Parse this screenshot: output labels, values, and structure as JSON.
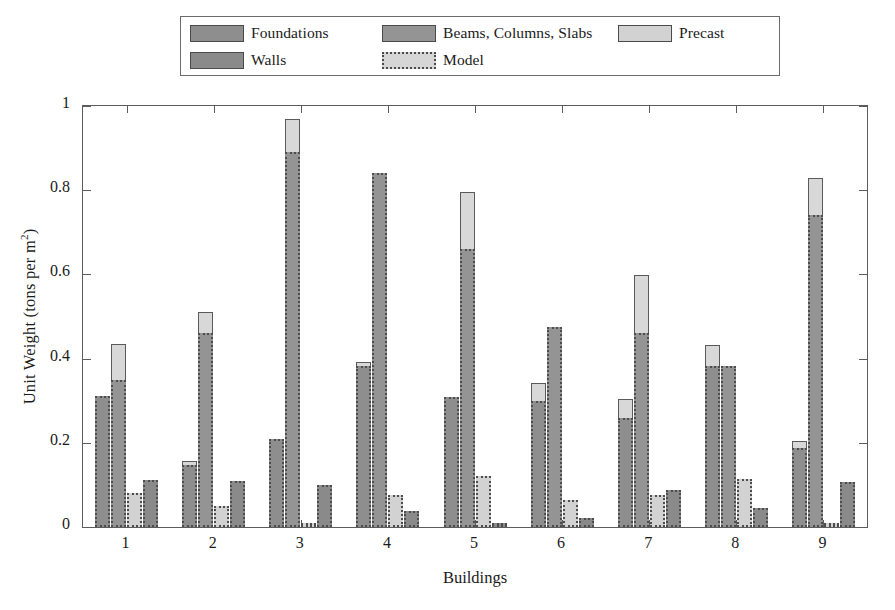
{
  "legend": {
    "entries": [
      {
        "label": "Foundations",
        "swatch": "foundations-swatch"
      },
      {
        "label": "Beams, Columns, Slabs",
        "swatch": "beams-columns-slabs-swatch"
      },
      {
        "label": "Precast",
        "swatch": "precast-swatch"
      },
      {
        "label": "Walls",
        "swatch": "walls-swatch"
      },
      {
        "label": "Model",
        "swatch": "model-swatch"
      }
    ]
  },
  "colors": {
    "foundations": "#8e8e8e",
    "beams": "#949494",
    "precast": "#d2d2d2",
    "walls": "#8a8a8a",
    "model": "#d8d8d8",
    "outline": "#4d4d4d",
    "axis": "#5c5c5c",
    "background": "#ffffff"
  },
  "chart_data": {
    "type": "bar",
    "title": "",
    "xlabel": "Buildings",
    "ylabel": "Unit Weight (tons per m 2)",
    "ylabel_base": "Unit Weight (tons per m",
    "ylabel_exp": "2",
    "ylabel_close": ")",
    "categories": [
      "1",
      "2",
      "3",
      "4",
      "5",
      "6",
      "7",
      "8",
      "9"
    ],
    "ylim": [
      0,
      1
    ],
    "yticks": [
      0,
      0.2,
      0.4,
      0.6,
      0.8,
      1
    ],
    "ytick_labels": [
      "0",
      "0.2",
      "0.4",
      "0.6",
      "0.8",
      "1"
    ],
    "grid": false,
    "legend_position": "above-plot",
    "series": [
      {
        "name": "Foundations",
        "values": [
          0.312,
          0.147,
          0.208,
          0.383,
          0.308,
          0.3,
          0.26,
          0.383,
          0.188
        ]
      },
      {
        "name": "Beams, Columns, Slabs",
        "values": [
          0.35,
          0.46,
          0.89,
          0.84,
          0.66,
          0.475,
          0.46,
          0.383,
          0.74
        ]
      },
      {
        "name": "Precast",
        "values": [
          0.08,
          0.05,
          0.003,
          0.075,
          0.12,
          0.063,
          0.075,
          0.115,
          0.003
        ]
      },
      {
        "name": "Walls",
        "values": [
          0.112,
          0.11,
          0.1,
          0.038,
          0.003,
          0.022,
          0.088,
          0.045,
          0.108
        ]
      }
    ],
    "model_overlay": {
      "name": "Model",
      "description": "Model value drawn as outlined light bar on top of the Foundations and Beams bars",
      "foundations": [
        0.312,
        0.157,
        0.208,
        0.392,
        0.308,
        0.343,
        0.305,
        0.433,
        0.205
      ],
      "beams": [
        0.435,
        0.51,
        0.968,
        0.84,
        0.795,
        0.475,
        0.598,
        0.383,
        0.828
      ]
    }
  }
}
